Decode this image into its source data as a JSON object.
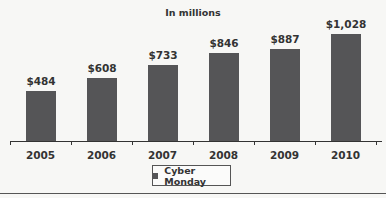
{
  "chart_data": {
    "type": "bar",
    "title": "In millions",
    "categories": [
      "2005",
      "2006",
      "2007",
      "2008",
      "2009",
      "2010"
    ],
    "series": [
      {
        "name": "Cyber Monday",
        "values": [
          484,
          608,
          733,
          846,
          887,
          1028
        ]
      }
    ],
    "value_labels": [
      "$484",
      "$608",
      "$733",
      "$846",
      "$887",
      "$1,028"
    ],
    "xlabel": "",
    "ylabel": "",
    "ylim": [
      0,
      1100
    ],
    "grid": false,
    "legend_position": "bottom-center",
    "colors": {
      "bar": "#555557",
      "background": "#f7f7f5"
    }
  }
}
